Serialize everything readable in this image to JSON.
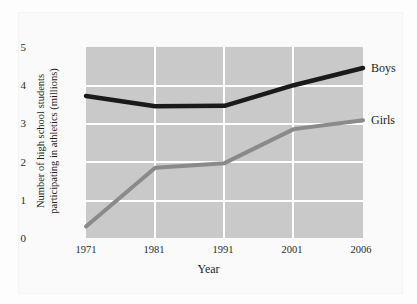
{
  "chart_data": {
    "type": "line",
    "title": "",
    "xlabel": "Year",
    "ylabel": "Number of high school students participating in athletics (millions)",
    "ylabel_line1": "Number of high school students",
    "ylabel_line2": "participating in athletics (millions)",
    "categories": [
      "1971",
      "1981",
      "1991",
      "2001",
      "2006"
    ],
    "ylim": [
      0,
      5
    ],
    "yticks": [
      "0",
      "1",
      "2",
      "3",
      "4",
      "5"
    ],
    "grid": true,
    "legend_position": "right-inline",
    "series": [
      {
        "name": "Boys",
        "color": "#1a1a1a",
        "values": [
          3.72,
          3.45,
          3.46,
          4.0,
          4.45
        ]
      },
      {
        "name": "Girls",
        "color": "#8a8a8a",
        "values": [
          0.3,
          1.84,
          1.96,
          2.85,
          3.08
        ]
      }
    ]
  },
  "style": {
    "plot_background": "#c9c9c9",
    "gridline_color": "#ffffff",
    "page_background": "#fdfdfd",
    "text_color": "#231f20"
  }
}
